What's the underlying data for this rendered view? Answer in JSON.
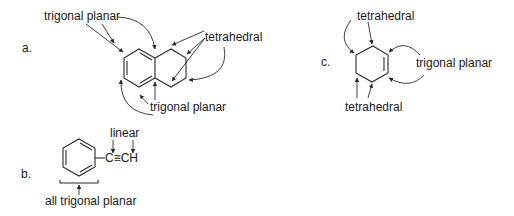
{
  "panels": {
    "a": {
      "marker": "a.",
      "molecule": "tetralin",
      "labels": {
        "top": "trigonal planar",
        "right": "tetrahedral",
        "bottom": "trigonal planar"
      }
    },
    "b": {
      "marker": "b.",
      "molecule": "phenylacetylene",
      "substituent": "C≡CH",
      "labels": {
        "top": "linear",
        "bottom": "all trigonal planar"
      }
    },
    "c": {
      "marker": "c.",
      "molecule": "cyclohexene",
      "labels": {
        "top": "tetrahedral",
        "right": "trigonal planar",
        "bottom": "tetrahedral"
      }
    }
  }
}
